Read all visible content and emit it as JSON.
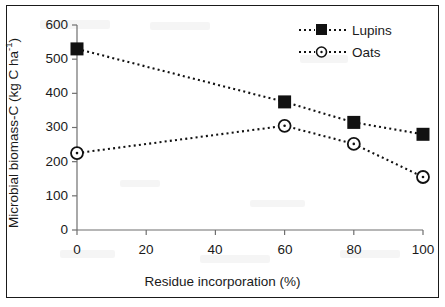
{
  "chart_data": {
    "type": "line",
    "title": "",
    "xlabel": "Residue incorporation (%)",
    "ylabel_text": "Microbial biomass-C (kg C ha",
    "ylabel_sup": "-1",
    "ylabel_tail": ")",
    "ylabel_full": "Microbial biomass-C (kg C ha-1)",
    "xlim": [
      0,
      100
    ],
    "ylim": [
      0,
      600
    ],
    "xticks": [
      0,
      20,
      40,
      60,
      80,
      100
    ],
    "yticks": [
      0,
      100,
      200,
      300,
      400,
      500,
      600
    ],
    "grid": false,
    "legend_position": "top-right",
    "line_style": "dotted",
    "series": [
      {
        "name": "Lupins",
        "marker": "filled-square",
        "color": "#111111",
        "x": [
          0,
          60,
          80,
          100
        ],
        "values": [
          530,
          375,
          315,
          280
        ]
      },
      {
        "name": "Oats",
        "marker": "open-circle",
        "color": "#111111",
        "x": [
          0,
          60,
          80,
          100
        ],
        "values": [
          225,
          305,
          252,
          155
        ]
      }
    ]
  },
  "legend": {
    "items": [
      {
        "label": "Lupins",
        "marker": "filled-square"
      },
      {
        "label": "Oats",
        "marker": "open-circle"
      }
    ]
  },
  "axes": {
    "x_tick_labels": [
      "0",
      "20",
      "40",
      "60",
      "80",
      "100"
    ],
    "y_tick_labels": [
      "0",
      "100",
      "200",
      "300",
      "400",
      "500",
      "600"
    ]
  }
}
